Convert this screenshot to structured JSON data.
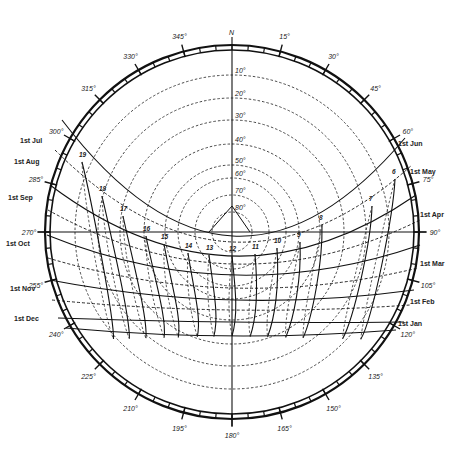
{
  "chart": {
    "north_label": "N",
    "center": [
      232,
      232
    ],
    "ring_radius": 187,
    "ring_gap": 5,
    "stroke_color": "#111111"
  },
  "azimuth_labels": [
    {
      "deg": 15,
      "text": "15°"
    },
    {
      "deg": 30,
      "text": "30°"
    },
    {
      "deg": 45,
      "text": "45°"
    },
    {
      "deg": 60,
      "text": "60°"
    },
    {
      "deg": 75,
      "text": "75°"
    },
    {
      "deg": 90,
      "text": "90°"
    },
    {
      "deg": 105,
      "text": "105°"
    },
    {
      "deg": 120,
      "text": "120°"
    },
    {
      "deg": 135,
      "text": "135°"
    },
    {
      "deg": 150,
      "text": "150°"
    },
    {
      "deg": 165,
      "text": "165°"
    },
    {
      "deg": 180,
      "text": "180°"
    },
    {
      "deg": 195,
      "text": "195°"
    },
    {
      "deg": 210,
      "text": "210°"
    },
    {
      "deg": 225,
      "text": "225°"
    },
    {
      "deg": 240,
      "text": "240°"
    },
    {
      "deg": 255,
      "text": "255°"
    },
    {
      "deg": 270,
      "text": "270°"
    },
    {
      "deg": 285,
      "text": "285°"
    },
    {
      "deg": 300,
      "text": "300°"
    },
    {
      "deg": 315,
      "text": "315°"
    },
    {
      "deg": 330,
      "text": "330°"
    },
    {
      "deg": 345,
      "text": "345°"
    }
  ],
  "altitude_labels": [
    {
      "alt": 10,
      "text": "10°"
    },
    {
      "alt": 20,
      "text": "20°"
    },
    {
      "alt": 30,
      "text": "30°"
    },
    {
      "alt": 40,
      "text": "40°"
    },
    {
      "alt": 50,
      "text": "50°"
    },
    {
      "alt": 60,
      "text": "60°"
    },
    {
      "alt": 70,
      "text": "70°"
    },
    {
      "alt": 80,
      "text": "80°"
    }
  ],
  "month_labels": [
    {
      "text": "1st Jul",
      "x": 20,
      "y": 143
    },
    {
      "text": "1st Aug",
      "x": 14,
      "y": 164
    },
    {
      "text": "1st Sep",
      "x": 8,
      "y": 200
    },
    {
      "text": "1st Oct",
      "x": 6,
      "y": 246
    },
    {
      "text": "1st Nov",
      "x": 10,
      "y": 291
    },
    {
      "text": "1st Dec",
      "x": 14,
      "y": 321
    },
    {
      "text": "1st Jun",
      "x": 398,
      "y": 146
    },
    {
      "text": "1st May",
      "x": 410,
      "y": 174
    },
    {
      "text": "1st Apr",
      "x": 420,
      "y": 217
    },
    {
      "text": "1st Mar",
      "x": 420,
      "y": 266
    },
    {
      "text": "1st Feb",
      "x": 410,
      "y": 304
    },
    {
      "text": "1st Jan",
      "x": 398,
      "y": 326
    }
  ],
  "hour_labels": [
    {
      "text": "6",
      "x": 395,
      "y": 176
    },
    {
      "text": "7",
      "x": 372,
      "y": 203
    },
    {
      "text": "8",
      "x": 322,
      "y": 222
    },
    {
      "text": "9",
      "x": 300,
      "y": 239
    },
    {
      "text": "10",
      "x": 277,
      "y": 245
    },
    {
      "text": "11",
      "x": 255,
      "y": 251
    },
    {
      "text": "12",
      "x": 232,
      "y": 253
    },
    {
      "text": "13",
      "x": 209,
      "y": 252
    },
    {
      "text": "14",
      "x": 188,
      "y": 250
    },
    {
      "text": "15",
      "x": 164,
      "y": 241
    },
    {
      "text": "16",
      "x": 146,
      "y": 233
    },
    {
      "text": "17",
      "x": 123,
      "y": 213
    },
    {
      "text": "18",
      "x": 102,
      "y": 193
    },
    {
      "text": "19",
      "x": 82,
      "y": 159
    }
  ]
}
